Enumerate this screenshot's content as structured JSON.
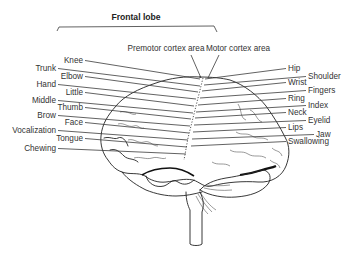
{
  "diagram": {
    "title": "Frontal lobe",
    "areas": {
      "premotor": "Premotor cortex area",
      "motor": "Motor cortex area"
    },
    "left_labels": [
      {
        "text": "Knee",
        "x": 83,
        "y": 63
      },
      {
        "text": "Trunk",
        "x": 56,
        "y": 71
      },
      {
        "text": "Elbow",
        "x": 83,
        "y": 79
      },
      {
        "text": "Hand",
        "x": 56,
        "y": 87
      },
      {
        "text": "Little",
        "x": 83,
        "y": 95
      },
      {
        "text": "Middle",
        "x": 56,
        "y": 103
      },
      {
        "text": "Thumb",
        "x": 83,
        "y": 110
      },
      {
        "text": "Brow",
        "x": 56,
        "y": 118
      },
      {
        "text": "Face",
        "x": 83,
        "y": 125
      },
      {
        "text": "Vocalization",
        "x": 56,
        "y": 133
      },
      {
        "text": "Tongue",
        "x": 83,
        "y": 141
      },
      {
        "text": "Chewing",
        "x": 56,
        "y": 151
      }
    ],
    "right_labels": [
      {
        "text": "Hip",
        "x": 288,
        "y": 71
      },
      {
        "text": "Shoulder",
        "x": 308,
        "y": 79
      },
      {
        "text": "Wrist",
        "x": 288,
        "y": 85
      },
      {
        "text": "Fingers",
        "x": 308,
        "y": 93
      },
      {
        "text": "Ring",
        "x": 288,
        "y": 101
      },
      {
        "text": "Index",
        "x": 308,
        "y": 108
      },
      {
        "text": "Neck",
        "x": 288,
        "y": 115
      },
      {
        "text": "Eyelid",
        "x": 308,
        "y": 123
      },
      {
        "text": "Lips",
        "x": 288,
        "y": 130
      },
      {
        "text": "Jaw",
        "x": 316,
        "y": 137
      },
      {
        "text": "Swallowing",
        "x": 288,
        "y": 144
      }
    ]
  }
}
